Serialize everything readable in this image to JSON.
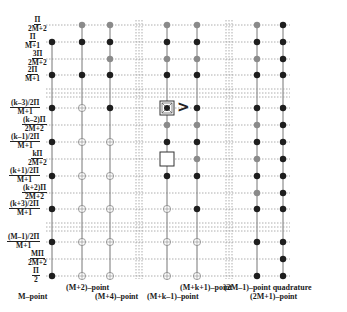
{
  "diagram": {
    "columns": [
      {
        "id": "M",
        "label": "M–point",
        "x": 52
      },
      {
        "id": "M+2",
        "label": "(M+2)–point",
        "x": 82
      },
      {
        "id": "M+4",
        "label": "(M+4)–point",
        "x": 110
      },
      {
        "id": "M+k-1",
        "label": "(M+k–1)–point",
        "x": 167
      },
      {
        "id": "M+k+1",
        "label": "(M+k+1)–point",
        "x": 197
      },
      {
        "id": "2M-1",
        "label": "(2M–1)–point quadrature",
        "x": 257
      },
      {
        "id": "2M+1",
        "label": "(2M+1)–point",
        "x": 283
      }
    ],
    "rows": [
      {
        "num": "Π",
        "den": "2M+2",
        "y": 25,
        "pts": [
          "",
          "g",
          "g",
          "g",
          "g",
          "g",
          "d"
        ]
      },
      {
        "num": "Π",
        "den": "M+1",
        "y": 42,
        "pts": [
          "d",
          "d",
          "d",
          "d",
          "d",
          "d",
          "d"
        ]
      },
      {
        "num": "3Π",
        "den": "2M+2",
        "y": 59,
        "pts": [
          "",
          "",
          "g",
          "g",
          "g",
          "g",
          "d"
        ]
      },
      {
        "num": "2Π",
        "den": "M+1",
        "y": 75,
        "pts": [
          "d",
          "d",
          "d",
          "d",
          "d",
          "d",
          "d"
        ]
      },
      {
        "num": "(k–3)/2Π",
        "den": "M+1",
        "y": 108,
        "pts": [
          "d",
          "o",
          "d",
          "X",
          "d",
          "d",
          "d"
        ]
      },
      {
        "num": "(k–2)Π",
        "den": "2M+2",
        "y": 125,
        "pts": [
          "",
          "",
          "",
          "g",
          "g",
          "g",
          "d"
        ]
      },
      {
        "num": "(k–1)/2Π",
        "den": "M+1",
        "y": 142,
        "pts": [
          "d",
          "o",
          "o",
          "d",
          "d",
          "d",
          "d"
        ]
      },
      {
        "num": "kΠ",
        "den": "2M+2",
        "y": 159,
        "pts": [
          "",
          "",
          "",
          "B",
          "g",
          "g",
          "d"
        ]
      },
      {
        "num": "(k+1)/2Π",
        "den": "M+1",
        "y": 176,
        "pts": [
          "d",
          "o",
          "o",
          "d",
          "d",
          "d",
          "d"
        ]
      },
      {
        "num": "(k+2)Π",
        "den": "2M+2",
        "y": 193,
        "pts": [
          "",
          "",
          "",
          "",
          "",
          "g",
          "d"
        ]
      },
      {
        "num": "(k+3)/2Π",
        "den": "M+1",
        "y": 209,
        "pts": [
          "d",
          "o",
          "o",
          "o",
          "d",
          "d",
          "d"
        ]
      },
      {
        "num": "(M–1)/2Π",
        "den": "M+1",
        "y": 242,
        "pts": [
          "d",
          "o",
          "o",
          "o",
          "o",
          "d",
          "d"
        ]
      },
      {
        "num": "MΠ",
        "den": "2M+2",
        "y": 259,
        "pts": [
          "",
          "",
          "",
          "",
          "",
          "",
          "d"
        ]
      },
      {
        "num": "Π",
        "den": "2",
        "y": 276,
        "pts": [
          "d",
          "o",
          "o",
          "o",
          "o",
          "d",
          "d"
        ]
      }
    ],
    "legend_codes": {
      "d": "dark filled point",
      "g": "gray filled point",
      "o": "open circle point",
      "X": "boxed marked point",
      "B": "empty box"
    },
    "arrow_symbol": ">",
    "colors": {
      "dark": "#1e1e1e",
      "gray": "#8a8a8a",
      "line": "#777777",
      "dash": "#9a9a9a"
    },
    "horizontal_breaks": [
      [
        89,
        93,
        97
      ],
      [
        223,
        227,
        231
      ]
    ],
    "vertical_breaks": [
      [
        136,
        139,
        142
      ],
      [
        226,
        229,
        232
      ]
    ]
  }
}
